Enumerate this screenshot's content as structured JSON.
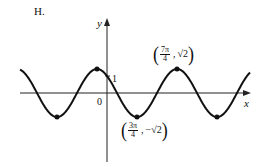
{
  "figure_label": "H.",
  "axes": {
    "x_label": "x",
    "y_label": "y",
    "origin_label": "0",
    "y_tick_label": "1"
  },
  "annotations": {
    "max_point": {
      "num": "7π",
      "den": "4",
      "y": "√2"
    },
    "min_point": {
      "num": "3π",
      "den": "4",
      "y": "−√2"
    }
  },
  "colors": {
    "curve": "#111111",
    "axes": "#222222",
    "background": "#ffffff"
  },
  "chart_data": {
    "type": "line",
    "title": "H.",
    "xlabel": "x",
    "ylabel": "y",
    "function": "y = cos x − sin x = √2 cos(x + π/4)",
    "series": [
      {
        "name": "curve",
        "x": [
          -3.39,
          -2.356,
          -0.785,
          0,
          2.356,
          3.927,
          5.498,
          7.069,
          8.64
        ],
        "values": [
          -0.74,
          -1.414,
          1.414,
          1,
          -1.414,
          1.414,
          -1.414,
          0,
          0
        ]
      }
    ],
    "key_points": [
      {
        "x": "-π/4",
        "y": "√2",
        "kind": "max"
      },
      {
        "x": "-5π/4",
        "y": "-√2",
        "kind": "min"
      },
      {
        "x": "3π/4",
        "y": "-√2",
        "kind": "min",
        "label": "(3π/4, −√2)"
      },
      {
        "x": "7π/4",
        "y": "√2",
        "kind": "max",
        "label": "(7π/4, √2)"
      },
      {
        "x": "11π/4",
        "y": "-√2",
        "kind": "min"
      }
    ],
    "y_intercept": 1,
    "grid": false
  }
}
